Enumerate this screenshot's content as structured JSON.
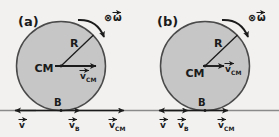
{
  "figure": {
    "background_color": "#f2f1ef",
    "ink_color": "#1b1b1b",
    "disk_fill_color": "#c6c6c6",
    "disk_stroke_color": "#4a4a4a",
    "ground_color": "#8a8a8a"
  },
  "panels": [
    {
      "id": "a",
      "label": "(a)",
      "radius_label": "R",
      "center_label": "CM",
      "center_velocity_label": "v",
      "center_velocity_sub": "CM",
      "contact_point_label": "B",
      "omega_label": "ω",
      "omega_marker": "⊗",
      "ground_velocities": [
        {
          "name": "v-left",
          "label": "v",
          "sub": "",
          "direction": "left"
        },
        {
          "name": "v-b",
          "label": "v",
          "sub": "B",
          "direction": "right"
        },
        {
          "name": "v-cm",
          "label": "v",
          "sub": "CM",
          "direction": "right"
        }
      ]
    },
    {
      "id": "b",
      "label": "(b)",
      "radius_label": "R",
      "center_label": "CM",
      "center_velocity_label": "v",
      "center_velocity_sub": "CM",
      "contact_point_label": "B",
      "omega_label": "ω",
      "omega_marker": "⊗",
      "ground_velocities": [
        {
          "name": "v-left",
          "label": "v",
          "sub": "",
          "direction": "left"
        },
        {
          "name": "v-b",
          "label": "v",
          "sub": "B",
          "direction": "right"
        },
        {
          "name": "v-cm",
          "label": "v",
          "sub": "CM",
          "direction": "right"
        }
      ]
    }
  ]
}
